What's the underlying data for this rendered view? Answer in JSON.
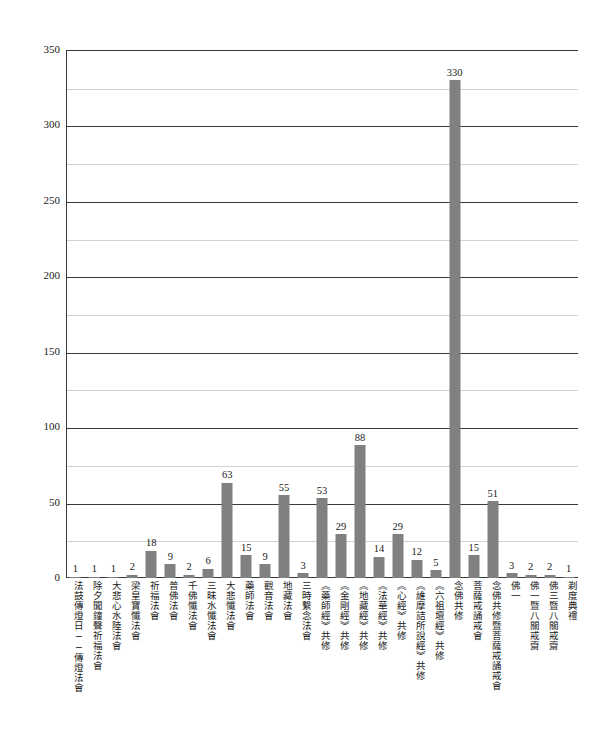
{
  "top_caption": "",
  "chart_data": {
    "type": "bar",
    "title": "",
    "subtitle": "",
    "xlabel": "",
    "ylabel": "",
    "ylim": [
      0,
      350
    ],
    "ytick_step": 50,
    "minor_tick_step": 25,
    "grid": true,
    "legend": false,
    "bar_color": "#808080",
    "axis_color": "#3a3a3a",
    "gridline_color": "#d2d2d2",
    "value_labels": true,
    "yticks": [
      0,
      50,
      100,
      150,
      200,
      250,
      300,
      350
    ],
    "categories": [
      "法鼓傳燈日──傳燈法會",
      "除夕聞鐘聲祈福法會",
      "大悲心水陸法會",
      "梁皇寶懺法會",
      "祈福法會",
      "普佛法會",
      "千佛懺法會",
      "三昧水懺法會",
      "大悲懺法會",
      "藥師法會",
      "觀音法會",
      "地藏法會",
      "三時繫念法會",
      "《藥師經》共修",
      "《金剛經》共修",
      "《地藏經》共修",
      "《法華經》共修",
      "《心經》共修",
      "《維摩詰所說經》共修",
      "《六祖壇經》共修",
      "念佛共修",
      "菩薩戒誦戒會",
      "念佛共修暨菩薩戒誦戒會",
      "佛一",
      "佛一暨八關戒齋",
      "佛三暨八關戒齋",
      "剃度典禮"
    ],
    "values": [
      1,
      1,
      1,
      2,
      18,
      9,
      2,
      6,
      63,
      15,
      9,
      55,
      3,
      53,
      29,
      88,
      14,
      29,
      12,
      5,
      330,
      15,
      51,
      3,
      2,
      2,
      1
    ]
  }
}
